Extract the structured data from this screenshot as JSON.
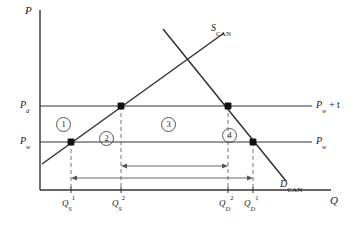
{
  "figure": {
    "type": "economics-supply-demand-tariff-diagram",
    "axes": {
      "y_label": "P",
      "x_label": "Q"
    },
    "price_levels": [
      {
        "id": "pd",
        "label_main": "P",
        "label_sub": "d",
        "y": 106
      },
      {
        "id": "pw",
        "label_main": "P",
        "label_sub": "w",
        "y": 142
      }
    ],
    "right_line_labels": [
      {
        "id": "pw-plus-t",
        "main": "P",
        "sub": "w",
        "rest": " + t",
        "y": 106
      },
      {
        "id": "pw",
        "main": "P",
        "sub": "w",
        "rest": "",
        "y": 142
      }
    ],
    "curves": [
      {
        "id": "supply",
        "label_main": "S",
        "label_sub": "CAN"
      },
      {
        "id": "demand",
        "label_main": "D",
        "label_sub": "CAN"
      }
    ],
    "x_ticks": [
      {
        "id": "qs1",
        "main": "Q",
        "sub": "S",
        "sup": "1",
        "x": 71
      },
      {
        "id": "qs2",
        "main": "Q",
        "sub": "S",
        "sup": "2",
        "x": 121
      },
      {
        "id": "qd2",
        "main": "Q",
        "sub": "D",
        "sup": "2",
        "x": 228
      },
      {
        "id": "qd1",
        "main": "Q",
        "sub": "D",
        "sup": "1",
        "x": 253
      }
    ],
    "regions": [
      {
        "id": "region-1",
        "label": "1",
        "x": 56,
        "y": 117
      },
      {
        "id": "region-2",
        "label": "2",
        "x": 99,
        "y": 131
      },
      {
        "id": "region-3",
        "label": "3",
        "x": 161,
        "y": 117
      },
      {
        "id": "region-4",
        "label": "4",
        "x": 222,
        "y": 128
      }
    ],
    "span_arrows": [
      {
        "id": "inner-span",
        "from_x": 121,
        "to_x": 228,
        "y": 166
      },
      {
        "id": "outer-span",
        "from_x": 71,
        "to_x": 253,
        "y": 178
      }
    ],
    "equilibrium_points": [
      {
        "id": "pt-supply-pw",
        "x": 71,
        "y": 142
      },
      {
        "id": "pt-supply-pd",
        "x": 121,
        "y": 106
      },
      {
        "id": "pt-demand-pd",
        "x": 228,
        "y": 106
      },
      {
        "id": "pt-demand-pw",
        "x": 253,
        "y": 142
      }
    ],
    "colors": {
      "line": "#333333",
      "dash": "#666666",
      "text": "#1a1a1a"
    }
  }
}
